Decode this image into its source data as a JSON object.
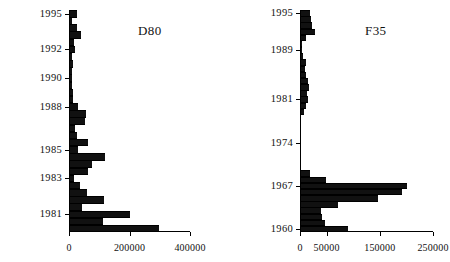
{
  "figure": {
    "panels": [
      {
        "id": "left",
        "title": "D80",
        "chart_data": {
          "type": "bar",
          "orientation": "horizontal",
          "title": "D80",
          "xlabel": "",
          "ylabel": "",
          "xlim": [
            0,
            450000
          ],
          "xticks": [
            0,
            200000,
            400000
          ],
          "xticklabels": [
            "0",
            "200000",
            "400000"
          ],
          "grid": false,
          "legend": null,
          "yticklabels": [
            "1995",
            "1992",
            "1990",
            "1988",
            "1985",
            "1983",
            "1981"
          ],
          "categories": [
            "1995",
            "1994",
            "1994",
            "1993",
            "1993",
            "1992",
            "1992",
            "1991",
            "1991",
            "1990",
            "1990",
            "1989",
            "1989",
            "1988",
            "1988",
            "1987",
            "1987",
            "1986",
            "1986",
            "1985",
            "1985",
            "1984",
            "1984",
            "1983",
            "1983",
            "1982",
            "1982",
            "1981",
            "1981",
            "1980"
          ],
          "values": [
            22000,
            8000,
            22000,
            38000,
            13000,
            17000,
            7000,
            9000,
            7000,
            5000,
            8000,
            9000,
            11000,
            26000,
            53000,
            50000,
            15000,
            24000,
            60000,
            26000,
            115000,
            72000,
            60000,
            12000,
            32000,
            57000,
            112000,
            40000,
            198000,
            110000,
            295000
          ]
        }
      },
      {
        "id": "right",
        "title": "F35",
        "chart_data": {
          "type": "bar",
          "orientation": "horizontal",
          "title": "F35",
          "xlabel": "",
          "ylabel": "",
          "xlim": [
            0,
            250000
          ],
          "xticks": [
            0,
            50000,
            150000,
            250000
          ],
          "xticklabels": [
            "0",
            "50000",
            "150000",
            "250000"
          ],
          "grid": false,
          "legend": null,
          "yticklabels": [
            "1995",
            "1989",
            "1981",
            "1974",
            "1967",
            "1960"
          ],
          "categories": [
            "1995",
            "1994",
            "1993",
            "1992",
            "1991",
            "1990",
            "1989",
            "1988",
            "1987",
            "1986",
            "1985",
            "1984",
            "1983",
            "1982",
            "1981",
            "1980",
            "1979",
            "1978",
            "1977",
            "1976",
            "1975",
            "1974",
            "1973",
            "1972",
            "1971",
            "1970",
            "1969",
            "1968",
            "1967",
            "1966",
            "1965",
            "1964",
            "1963",
            "1962",
            "1961",
            "1960"
          ],
          "values": [
            17000,
            18000,
            20000,
            26000,
            10000,
            2000,
            1000,
            4000,
            9000,
            7000,
            9000,
            13000,
            15000,
            11000,
            13000,
            9000,
            6000,
            0,
            0,
            0,
            0,
            0,
            0,
            0,
            0,
            0,
            16000,
            47000,
            200000,
            190000,
            145000,
            70000,
            38000,
            40000,
            45000,
            88000
          ]
        }
      }
    ]
  }
}
